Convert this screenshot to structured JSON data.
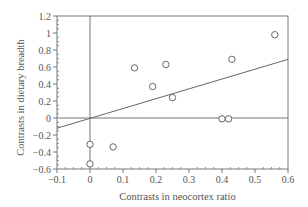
{
  "chart_data": {
    "type": "scatter",
    "title": "",
    "xlabel": "Contrasts in neocortex ratio",
    "ylabel": "Contrasts in dietary breadth",
    "xlim": [
      -0.1,
      0.6
    ],
    "ylim": [
      -0.6,
      1.2
    ],
    "x_ticks": [
      -0.1,
      0,
      0.1,
      0.2,
      0.3,
      0.4,
      0.5,
      0.6
    ],
    "x_tick_labels": [
      "−0.1",
      "0",
      "0.1",
      "0.2",
      "0.3",
      "0.4",
      "0.5",
      "0.6"
    ],
    "y_ticks": [
      -0.6,
      -0.4,
      -0.2,
      0,
      0.2,
      0.4,
      0.6,
      0.8,
      1,
      1.2
    ],
    "y_tick_labels": [
      "−0.6",
      "−0.4",
      "−0.2",
      "0",
      "0.2",
      "0.4",
      "0.6",
      "0.8",
      "1",
      "1.2"
    ],
    "grid": false,
    "legend": null,
    "series": [
      {
        "name": "contrasts",
        "marker": "open-circle",
        "points": [
          {
            "x": 0.0,
            "y": -0.31
          },
          {
            "x": 0.0,
            "y": -0.54
          },
          {
            "x": 0.07,
            "y": -0.34
          },
          {
            "x": 0.135,
            "y": 0.59
          },
          {
            "x": 0.19,
            "y": 0.37
          },
          {
            "x": 0.23,
            "y": 0.63
          },
          {
            "x": 0.25,
            "y": 0.24
          },
          {
            "x": 0.4,
            "y": -0.01
          },
          {
            "x": 0.42,
            "y": -0.01
          },
          {
            "x": 0.43,
            "y": 0.69
          },
          {
            "x": 0.56,
            "y": 0.98
          }
        ]
      }
    ],
    "regression_line": {
      "x0": -0.1,
      "y0": -0.12,
      "x1": 0.6,
      "y1": 0.69
    },
    "reference_lines": {
      "x_zero": true,
      "y_zero": true
    }
  },
  "colors": {
    "axis": "#777777",
    "line": "#666666",
    "marker": "#666666",
    "text": "#555555"
  }
}
